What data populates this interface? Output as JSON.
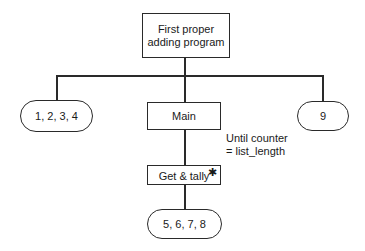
{
  "diagram": {
    "type": "structure-chart",
    "nodes": {
      "root": {
        "label_line1": "First proper",
        "label_line2": "adding program",
        "shape": "rectangle"
      },
      "left": {
        "label": "1, 2, 3, 4",
        "shape": "rounded"
      },
      "main": {
        "label": "Main",
        "shape": "rectangle"
      },
      "right": {
        "label": "9",
        "shape": "rounded"
      },
      "get_tally": {
        "label": "Get & tally",
        "shape": "rectangle",
        "marker": "✱"
      },
      "bottom": {
        "label": "5, 6, 7, 8",
        "shape": "rounded"
      }
    },
    "annotation": {
      "line1": "Until counter",
      "line2": "= list_length"
    },
    "edges": [
      [
        "root",
        "left"
      ],
      [
        "root",
        "main"
      ],
      [
        "root",
        "right"
      ],
      [
        "main",
        "get_tally"
      ],
      [
        "get_tally",
        "bottom"
      ]
    ]
  }
}
